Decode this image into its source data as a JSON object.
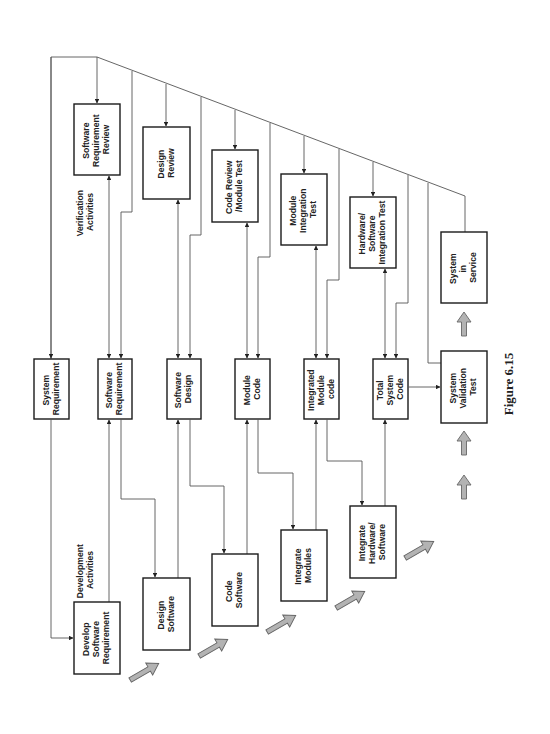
{
  "figure": {
    "caption": "Figure 6.15",
    "orientation": "rotated 90° counter-clockwise (landscape figure on portrait page)"
  },
  "headings": {
    "verification": [
      "Verification",
      "Activities"
    ],
    "development": [
      "Development",
      "Activities"
    ]
  },
  "verification_boxes": [
    {
      "id": "sw-req-review",
      "lines": [
        "Software",
        "Requirement",
        "Review"
      ]
    },
    {
      "id": "design-review",
      "lines": [
        "Design",
        "Review"
      ]
    },
    {
      "id": "code-review",
      "lines": [
        "Code Review",
        "/Module Test"
      ]
    },
    {
      "id": "module-integration-test",
      "lines": [
        "Module",
        "Integration",
        "Test"
      ]
    },
    {
      "id": "hw-sw-integration-test",
      "lines": [
        "Hardware/",
        "Software",
        "Integration Test"
      ]
    },
    {
      "id": "system-in-service",
      "lines": [
        "System",
        "in",
        "Service"
      ]
    }
  ],
  "artifact_boxes": [
    {
      "id": "system-requirement",
      "lines": [
        "System",
        "Requirement"
      ]
    },
    {
      "id": "software-requirement",
      "lines": [
        "Software",
        "Requirement"
      ]
    },
    {
      "id": "software-design",
      "lines": [
        "Software",
        "Design"
      ]
    },
    {
      "id": "module-code",
      "lines": [
        "Module",
        "Code"
      ]
    },
    {
      "id": "integrated-module-code",
      "lines": [
        "Integrated",
        "Module",
        "code"
      ]
    },
    {
      "id": "total-system-code",
      "lines": [
        "Total",
        "System",
        "Code"
      ]
    },
    {
      "id": "system-validation-test",
      "lines": [
        "System",
        "Validation",
        "Test"
      ]
    }
  ],
  "development_boxes": [
    {
      "id": "develop-sw-req",
      "lines": [
        "Develop",
        "Software",
        "Requirement"
      ]
    },
    {
      "id": "design-software",
      "lines": [
        "Design",
        "Software"
      ]
    },
    {
      "id": "code-software",
      "lines": [
        "Code",
        "Software"
      ]
    },
    {
      "id": "integrate-modules",
      "lines": [
        "Integrate",
        "Modules"
      ]
    },
    {
      "id": "integrate-hw-sw",
      "lines": [
        "Integrate",
        "Hardware/",
        "Software"
      ]
    }
  ],
  "colors": {
    "box_stroke": "#1a1a1a",
    "connector": "#555555",
    "flow_arrow_fill": "#b3b3b3",
    "text": "#222222"
  }
}
